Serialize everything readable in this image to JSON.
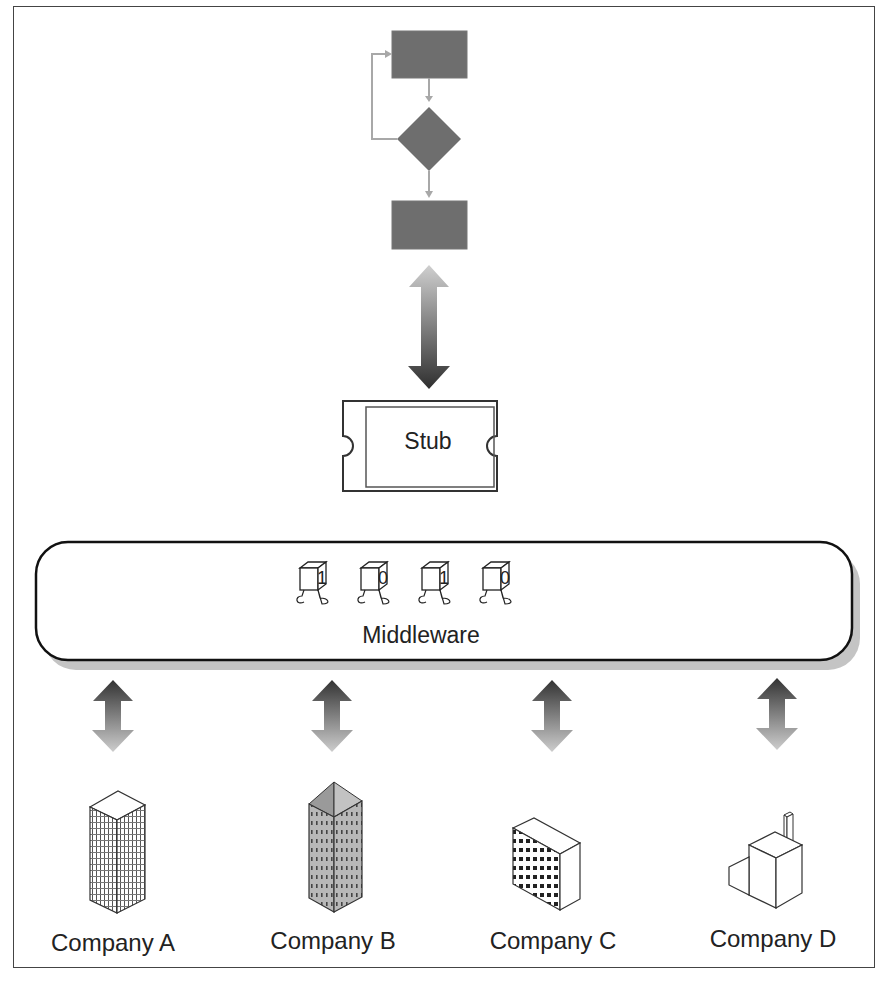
{
  "diagram": {
    "flowchart": {
      "nodes": [
        "process-box-top",
        "decision-diamond",
        "process-box-bottom"
      ],
      "fill": "#6e6e6e",
      "connector_color": "#a8a8a8"
    },
    "stub": {
      "label": "Stub"
    },
    "middleware": {
      "label": "Middleware",
      "bits": [
        "1",
        "0",
        "1",
        "0"
      ]
    },
    "companies": [
      {
        "label": "Company A",
        "icon": "office-tower-icon"
      },
      {
        "label": "Company B",
        "icon": "pyramid-roof-tower-icon"
      },
      {
        "label": "Company C",
        "icon": "office-block-icon"
      },
      {
        "label": "Company D",
        "icon": "factory-icon"
      }
    ],
    "colors": {
      "frame": "#444444",
      "shadow": "#c4c4c4",
      "arrow_dark": "#3a3a3a",
      "arrow_light": "#c8c8c8"
    }
  }
}
